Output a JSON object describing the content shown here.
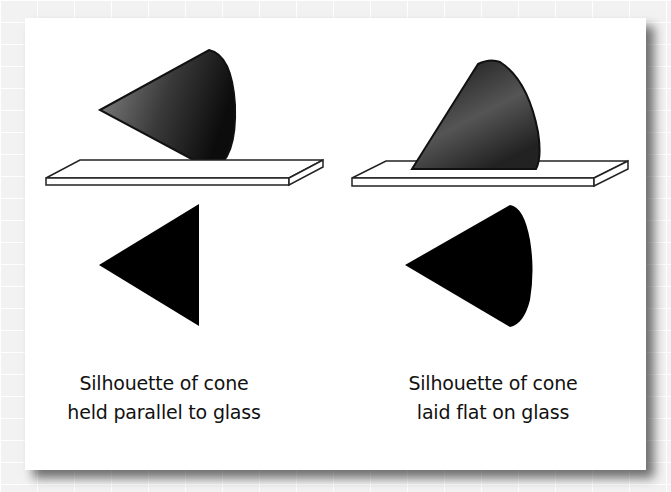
{
  "figure": {
    "panels": [
      {
        "id": "parallel",
        "caption_line1": "Silhouette of cone",
        "caption_line2": "held parallel to glass",
        "silhouette_shape": "triangle"
      },
      {
        "id": "flat",
        "caption_line1": "Silhouette of cone",
        "caption_line2": "laid flat on glass",
        "silhouette_shape": "rounded-sector"
      }
    ],
    "colors": {
      "background": "#f2f2f2",
      "panel": "#ffffff",
      "cone_dark": "#111111",
      "cone_light": "#8a8a8a",
      "silhouette": "#000000",
      "glass_fill": "#ffffff",
      "glass_stroke": "#222222"
    }
  }
}
